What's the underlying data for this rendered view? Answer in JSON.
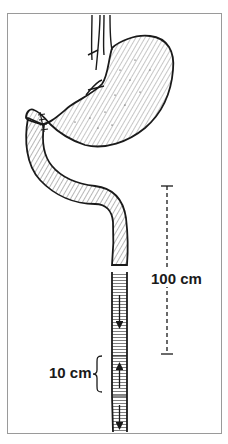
{
  "figure": {
    "labels": {
      "limb_length": "100 cm",
      "segment_length": "10 cm"
    },
    "arrows": [
      {
        "segment": "upper",
        "direction": "down"
      },
      {
        "segment": "reversed",
        "direction": "up"
      },
      {
        "segment": "lower",
        "direction": "down"
      }
    ],
    "colors": {
      "line": "#1a1a1a",
      "frame": "#9a9a9a",
      "background": "#ffffff"
    }
  }
}
